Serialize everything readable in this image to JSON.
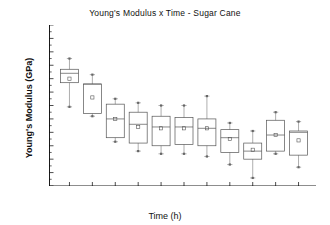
{
  "chart_data": {
    "type": "box",
    "title": "Young's Modulus x Time - Sugar Cane",
    "xlabel": "Time (h)",
    "ylabel": "Young's Modulus (GPa)",
    "ylim": [
      4.0,
      5.2
    ],
    "ytick_step": 0.1,
    "yticks": [
      "5.2",
      "5.1",
      "5.0",
      "4.9",
      "4.8",
      "4.7",
      "4.6",
      "4.5",
      "4.4",
      "4.3",
      "4.2",
      "4.1",
      "4.0"
    ],
    "grid": false,
    "legend": "none",
    "categories": [
      "0",
      "168",
      "504",
      "840",
      "1176",
      "1512",
      "1992",
      "2496",
      "3000",
      "3672",
      "4440"
    ],
    "series": [
      {
        "name": "Young's Modulus (GPa)",
        "boxes": [
          {
            "category": "0",
            "whisker_low": 4.59,
            "q1": 4.77,
            "median": 4.84,
            "mean": 4.8,
            "q3": 4.87,
            "whisker_high": 4.95
          },
          {
            "category": "168",
            "whisker_low": 4.52,
            "q1": 4.54,
            "median": 4.76,
            "mean": 4.66,
            "q3": 4.76,
            "whisker_high": 4.83
          },
          {
            "category": "504",
            "whisker_low": 4.33,
            "q1": 4.36,
            "median": 4.5,
            "mean": 4.5,
            "q3": 4.61,
            "whisker_high": 4.65
          },
          {
            "category": "840",
            "whisker_low": 4.26,
            "q1": 4.32,
            "median": 4.46,
            "mean": 4.44,
            "q3": 4.55,
            "whisker_high": 4.62
          },
          {
            "category": "1176",
            "whisker_low": 4.24,
            "q1": 4.3,
            "median": 4.44,
            "mean": 4.43,
            "q3": 4.52,
            "whisker_high": 4.6
          },
          {
            "category": "1512",
            "whisker_low": 4.24,
            "q1": 4.31,
            "median": 4.44,
            "mean": 4.43,
            "q3": 4.51,
            "whisker_high": 4.6
          },
          {
            "category": "1992",
            "whisker_low": 4.22,
            "q1": 4.3,
            "median": 4.43,
            "mean": 4.43,
            "q3": 4.5,
            "whisker_high": 4.67
          },
          {
            "category": "2496",
            "whisker_low": 4.16,
            "q1": 4.25,
            "median": 4.36,
            "mean": 4.35,
            "q3": 4.42,
            "whisker_high": 4.47
          },
          {
            "category": "3000",
            "whisker_low": 4.06,
            "q1": 4.2,
            "median": 4.26,
            "mean": 4.27,
            "q3": 4.32,
            "whisker_high": 4.41
          },
          {
            "category": "3672",
            "whisker_low": 4.24,
            "q1": 4.26,
            "median": 4.38,
            "mean": 4.38,
            "q3": 4.49,
            "whisker_high": 4.55
          },
          {
            "category": "4440",
            "whisker_low": 4.14,
            "q1": 4.23,
            "median": 4.4,
            "mean": 4.34,
            "q3": 4.41,
            "whisker_high": 4.48
          }
        ]
      }
    ]
  },
  "title": "Young's Modulus x Time - Sugar Cane",
  "axes": {
    "x_title": "Time (h)",
    "y_title": "Young's Modulus (GPa)"
  }
}
